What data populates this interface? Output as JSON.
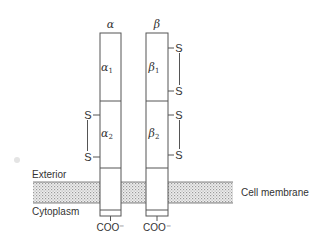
{
  "diagram": {
    "type": "membrane receptor schematic",
    "chains": [
      {
        "id": "alpha",
        "label": "α",
        "segments": [
          {
            "label": "α",
            "subscript": "1"
          },
          {
            "label": "α",
            "subscript": "2"
          }
        ],
        "disulfide_bridges": [
          {
            "segment": "alpha2",
            "side": "left",
            "atoms": [
              "S",
              "S"
            ]
          }
        ],
        "terminus": "COO⁻"
      },
      {
        "id": "beta",
        "label": "β",
        "segments": [
          {
            "label": "β",
            "subscript": "1"
          },
          {
            "label": "β",
            "subscript": "2"
          }
        ],
        "disulfide_bridges": [
          {
            "segment": "beta1",
            "side": "right",
            "atoms": [
              "S",
              "S"
            ]
          },
          {
            "segment": "beta2",
            "side": "right",
            "atoms": [
              "S",
              "S"
            ]
          }
        ],
        "terminus": "COO⁻"
      }
    ],
    "regions": {
      "exterior": "Exterior",
      "cytoplasm": "Cytoplasm",
      "membrane": "Cell membrane"
    },
    "colors": {
      "line": "#555555",
      "text": "#333333",
      "membrane_fill": "#d8d8d8"
    }
  }
}
